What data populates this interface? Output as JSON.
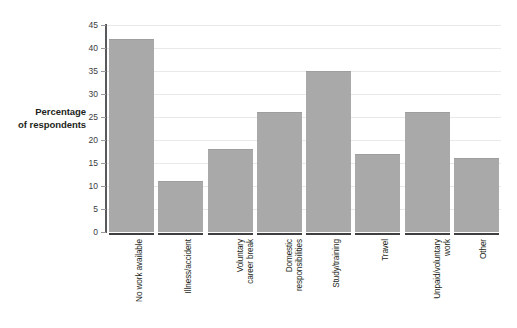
{
  "chart_data": {
    "type": "bar",
    "title": "",
    "subtitle": "",
    "xlabel": "",
    "ylabel": "Percentage of respondents",
    "ylabel_lines": [
      "Percentage",
      "of respondents"
    ],
    "categories": [
      "No work available",
      "Illness/accident",
      "Voluntary career break",
      "Domestic responsibilities",
      "Study/training",
      "Travel",
      "Unpaid/voluntary work",
      "Other"
    ],
    "category_label_lines": [
      [
        "No work available"
      ],
      [
        "Illness/accident"
      ],
      [
        "Voluntary",
        "career break"
      ],
      [
        "Domestic",
        "responsibilities"
      ],
      [
        "Study/training"
      ],
      [
        "Travel"
      ],
      [
        "Unpaid/voluntary",
        "work"
      ],
      [
        "Other"
      ]
    ],
    "values": [
      42,
      11,
      18,
      26,
      35,
      17,
      26,
      16
    ],
    "ylim": [
      0,
      45
    ],
    "ytick_labels": [
      "0",
      "5",
      "10",
      "15",
      "20",
      "25",
      "30",
      "35",
      "40",
      "45"
    ],
    "ytick_values": [
      0,
      5,
      10,
      15,
      20,
      25,
      30,
      35,
      40,
      45
    ],
    "grid": true,
    "legend": false,
    "legend_position": "none",
    "bar_color": "#a9a9a9",
    "gridline_color": "#e9e9ea",
    "axis_color": "#58595b",
    "text_color": "#231f20",
    "background_color": "#ffffff"
  }
}
